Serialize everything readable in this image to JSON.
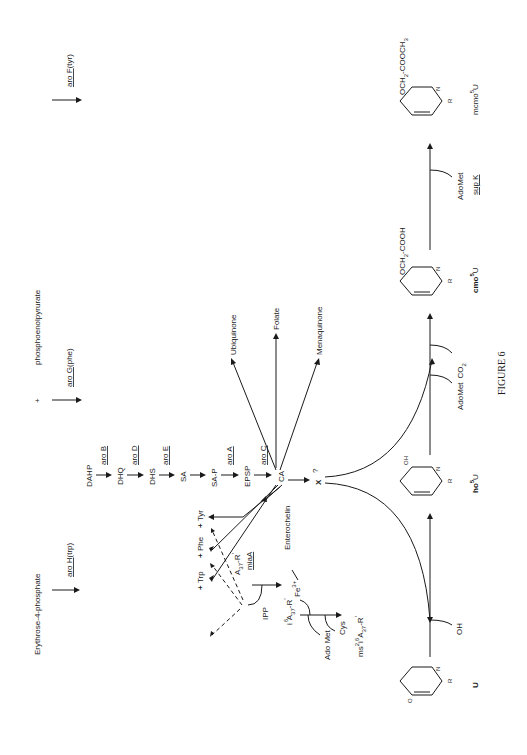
{
  "figure": {
    "caption": "FIGURE 6",
    "orientation": "rotated-90-ccw"
  },
  "precursors": {
    "erythrose": "Erythrose-4-phosphate",
    "plus": "+",
    "pep": "phosphoenolpyrurate"
  },
  "enzymes": {
    "aroH": "aro H",
    "aroH_suffix": "(trp)",
    "aroG": "aro G",
    "aroG_suffix": "(phe)",
    "aroF": "aro F",
    "aroF_suffix": "(tyr)",
    "aroB": "aro B",
    "aroD": "aro D",
    "aroE": "aro E",
    "aroA": "aro A",
    "aroC": "aro C",
    "miaA": "miaA",
    "supK": "sup K"
  },
  "pathway": {
    "intermediates": [
      "DAHP",
      "DHQ",
      "DHS",
      "SA",
      "SA-P",
      "EPSP",
      "CA"
    ],
    "products": [
      "Ubiquinone",
      "Folate",
      "Menaquinone",
      "Enterochelin"
    ],
    "amino_acids": [
      "Trp",
      "Phe",
      "Tyr"
    ],
    "unknown": "X",
    "unknown_q": "?"
  },
  "trna": {
    "a37_base": "A",
    "a37_sub": "37",
    "a37_suffix": "-R",
    "prime": "'",
    "ipp": "IPP",
    "i6_pre": "i",
    "i6_sup": "6",
    "adomet": "Ado Met",
    "fe": "Fe",
    "fe_sup": "3+",
    "cys": "Cys",
    "ms_pre": "ms",
    "ms_sup": "2",
    "i_pre": "i",
    "i_sup": "6"
  },
  "uridine": {
    "u_label": "U",
    "oh_reagent": "OH",
    "ho5u_label": "ho",
    "ho5u_sup": "5",
    "ho5u_U": "U",
    "ho_sub": "OH",
    "adomet_co2_1": "AdoMet",
    "adomet_co2_2": "CO",
    "co2_sub": "2",
    "cmo_sub": "OCH",
    "cmo_sub2": "2",
    "cmo_sub3": "-COOH",
    "cmo5u_label": "cmo",
    "cmo5u_sup": "5",
    "cmo5u_U": "U",
    "adomet_supk": "AdoMet",
    "mcmo_sub": "OCH",
    "mcmo_sub2": "2",
    "mcmo_sub3": "-COOCH",
    "mcmo_sub4": "3",
    "mcmo5u_label": "mcmo",
    "mcmo5u_sup": "5",
    "mcmo5u_U": "U",
    "ring_N": "N",
    "ring_O": "O",
    "ring_R": "R"
  }
}
